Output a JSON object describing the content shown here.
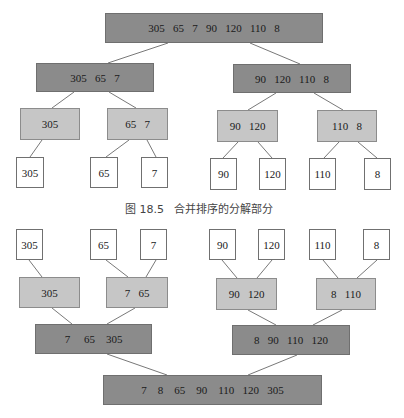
{
  "figure_top": {
    "caption": "图 18.5   合并排序的分解部分",
    "root": "305   65   7   90   120   110   8",
    "level1": [
      "305   65   7",
      "90   120   110   8"
    ],
    "level2": [
      "305",
      "65   7",
      "90   120",
      "110   8"
    ],
    "leaves": [
      "305",
      "65",
      "7",
      "90",
      "120",
      "110",
      "8"
    ]
  },
  "figure_bottom": {
    "leaves": [
      "305",
      "65",
      "7",
      "90",
      "120",
      "110",
      "8"
    ],
    "level2": [
      "305",
      "7   65",
      "90   120",
      "8   110"
    ],
    "level1": [
      "7     65    305",
      "8   90   110   120"
    ],
    "root": "7    8    65    90    110   120   305"
  },
  "colors": {
    "dark_box": "#8b8b8b",
    "light_box": "#c6c6c6",
    "leaf_box": "#ffffff",
    "line": "#555555"
  }
}
